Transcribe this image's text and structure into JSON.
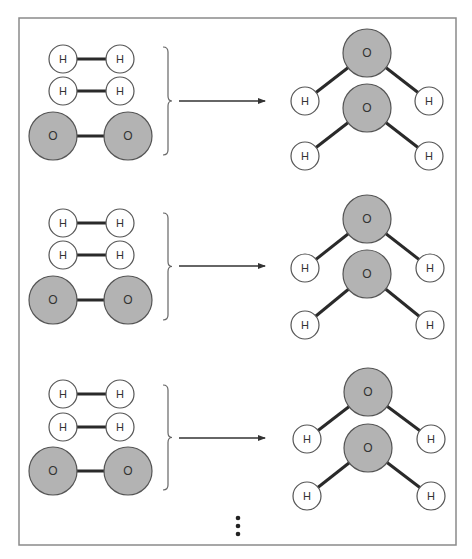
{
  "diagram": {
    "colors": {
      "frame": "#8a8a8a",
      "bond": "#2a2a2a",
      "hydrogen_fill": "#ffffff",
      "hydrogen_stroke": "#555555",
      "oxygen_fill": "#b3b3b3",
      "oxygen_stroke": "#555555",
      "label": "#333333",
      "arrow": "#333333"
    },
    "labels": {
      "hydrogen": "H",
      "oxygen": "O"
    },
    "continuation": "more reactions (vertical ellipsis)",
    "groups": [
      {
        "reactants": {
          "h2": [
            {
              "y": 59
            },
            {
              "y": 91
            }
          ],
          "o2": {
            "y": 136
          }
        },
        "brace": {
          "top": 47,
          "bottom": 155
        },
        "arrow_y": 101,
        "products": [
          {
            "o": [
              367,
              53
            ],
            "h": [
              [
                305,
                101
              ],
              [
                429,
                101
              ]
            ]
          },
          {
            "o": [
              367,
              108
            ],
            "h": [
              [
                305,
                156
              ],
              [
                429,
                156
              ]
            ]
          }
        ]
      },
      {
        "reactants": {
          "h2": [
            {
              "y": 223
            },
            {
              "y": 255
            }
          ],
          "o2": {
            "y": 300
          }
        },
        "brace": {
          "top": 213,
          "bottom": 320
        },
        "arrow_y": 266,
        "products": [
          {
            "o": [
              367,
              219
            ],
            "h": [
              [
                305,
                268
              ],
              [
                430,
                268
              ]
            ]
          },
          {
            "o": [
              367,
              274
            ],
            "h": [
              [
                305,
                325
              ],
              [
                430,
                325
              ]
            ]
          }
        ]
      },
      {
        "reactants": {
          "h2": [
            {
              "y": 394
            },
            {
              "y": 427
            }
          ],
          "o2": {
            "y": 471
          }
        },
        "brace": {
          "top": 385,
          "bottom": 490
        },
        "arrow_y": 438,
        "products": [
          {
            "o": [
              368,
              392
            ],
            "h": [
              [
                307,
                439
              ],
              [
                431,
                439
              ]
            ]
          },
          {
            "o": [
              368,
              448
            ],
            "h": [
              [
                307,
                496
              ],
              [
                431,
                496
              ]
            ]
          }
        ]
      }
    ],
    "ellipsis_dots": [
      518,
      526,
      534
    ]
  }
}
